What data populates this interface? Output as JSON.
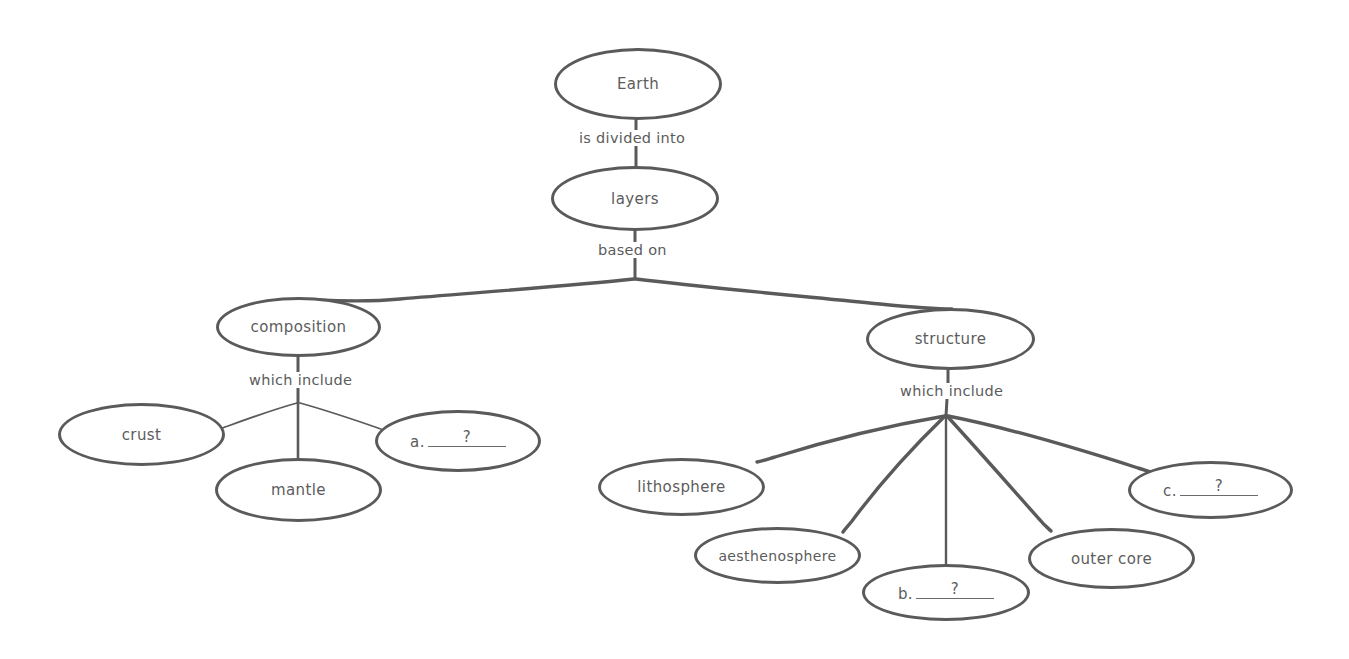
{
  "diagram": {
    "stroke_color": "#5a5a5a",
    "text_color": "#5c5c5c",
    "background_color": "#ffffff",
    "nodes": [
      {
        "id": "earth",
        "label": "Earth",
        "kind": "concept"
      },
      {
        "id": "layers",
        "label": "layers",
        "kind": "concept"
      },
      {
        "id": "composition",
        "label": "composition",
        "kind": "concept"
      },
      {
        "id": "structure",
        "label": "structure",
        "kind": "concept"
      },
      {
        "id": "crust",
        "label": "crust",
        "kind": "concept"
      },
      {
        "id": "mantle",
        "label": "mantle",
        "kind": "concept"
      },
      {
        "id": "blank_a",
        "label": "a.",
        "kind": "blank",
        "placeholder": "?"
      },
      {
        "id": "lithosphere",
        "label": "lithosphere",
        "kind": "concept"
      },
      {
        "id": "aesthenosphere",
        "label": "aesthenosphere",
        "kind": "concept"
      },
      {
        "id": "blank_b",
        "label": "b.",
        "kind": "blank",
        "placeholder": "?"
      },
      {
        "id": "outer_core",
        "label": "outer core",
        "kind": "concept"
      },
      {
        "id": "blank_c",
        "label": "c.",
        "kind": "blank",
        "placeholder": "?"
      }
    ],
    "edge_labels": [
      {
        "id": "earth_to_layers",
        "label": "is divided into"
      },
      {
        "id": "layers_to_branches",
        "label": "based on"
      },
      {
        "id": "composition_to_children",
        "label": "which include"
      },
      {
        "id": "structure_to_children",
        "label": "which include"
      }
    ]
  }
}
